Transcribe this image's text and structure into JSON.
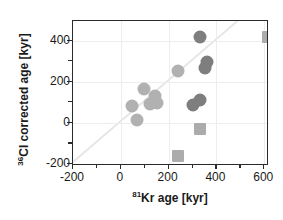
{
  "chart_data": {
    "type": "scatter",
    "title": "",
    "xlabel": "81Kr age [kyr]",
    "ylabel": "36Cl corrected age [kyr]",
    "xlabel_sup": "81",
    "xlabel_rest": "Kr age [kyr]",
    "ylabel_sup": "36",
    "ylabel_rest": "Cl corrected age [kyr]",
    "xlim": [
      -200,
      620
    ],
    "ylim": [
      -210,
      495
    ],
    "xticks": [
      -200,
      0,
      200,
      400,
      600
    ],
    "xtick_labels": [
      "-200",
      "0",
      "200",
      "400",
      "600"
    ],
    "yticks": [
      -200,
      0,
      200,
      400
    ],
    "ytick_labels": [
      "-200",
      "0",
      "200",
      "400"
    ],
    "x_minor_ticks": [
      -100,
      100,
      300,
      500
    ],
    "y_minor_ticks": [
      -100,
      100,
      300
    ],
    "grid": true,
    "grid_color": "#ededed",
    "identity_line": true,
    "identity_line_color": "#e6e6e6",
    "legend": "none",
    "series": [
      {
        "name": "light-gray circles",
        "marker": "circle",
        "color": "#b1b1b1",
        "size": 13,
        "points": [
          {
            "x": 48,
            "y": 80
          },
          {
            "x": 68,
            "y": 12
          },
          {
            "x": 98,
            "y": 163
          },
          {
            "x": 122,
            "y": 92
          },
          {
            "x": 145,
            "y": 128
          },
          {
            "x": 152,
            "y": 98
          },
          {
            "x": 240,
            "y": 250
          }
        ]
      },
      {
        "name": "dark-gray circles",
        "marker": "circle",
        "color": "#7e7e7e",
        "size": 13,
        "points": [
          {
            "x": 332,
            "y": 418
          },
          {
            "x": 362,
            "y": 298
          },
          {
            "x": 352,
            "y": 265
          },
          {
            "x": 300,
            "y": 85
          },
          {
            "x": 330,
            "y": 112
          }
        ]
      },
      {
        "name": "light-gray squares",
        "marker": "square",
        "color": "#acacac",
        "size": 12,
        "points": [
          {
            "x": 240,
            "y": -162
          },
          {
            "x": 330,
            "y": -28
          },
          {
            "x": 615,
            "y": 418
          }
        ]
      }
    ]
  }
}
